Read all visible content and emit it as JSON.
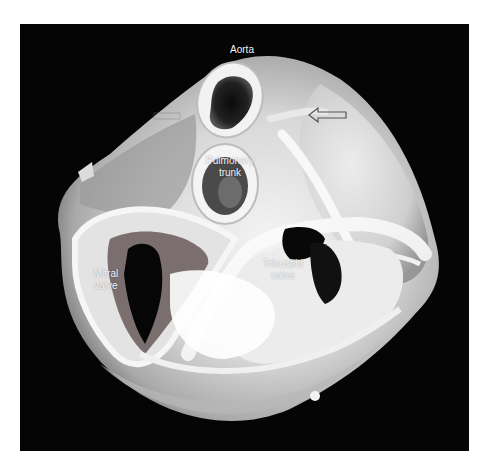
{
  "figure": {
    "background_color": "#050505",
    "labels": {
      "aorta": "Aorta",
      "pulmonary_trunk": "Pulmonary\ntrunk",
      "mitral_valve": "Mitral\nvalve",
      "tricuspid_valve": "Tricuspid\nvalve"
    },
    "annotations": [
      {
        "type": "hollow-arrow",
        "direction": "left",
        "x": 308,
        "y": 107
      },
      {
        "type": "hollow-arrow-faint",
        "direction": "right",
        "x": 153,
        "y": 112
      }
    ]
  }
}
